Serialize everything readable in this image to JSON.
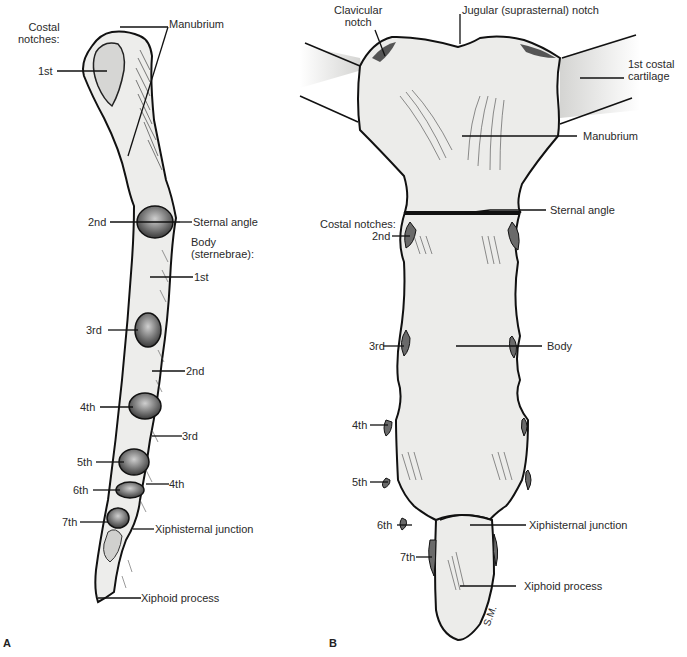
{
  "figure": {
    "panels": [
      {
        "id": "A",
        "view": "lateral",
        "panel_label": "A",
        "labels": {
          "manubrium": "Manubrium",
          "costal_notches_heading_1": "Costal",
          "costal_notches_heading_2": "notches:",
          "notch_1st": "1st",
          "notch_2nd": "2nd",
          "notch_3rd": "3rd",
          "notch_4th": "4th",
          "notch_5th": "5th",
          "notch_6th": "6th",
          "notch_7th": "7th",
          "sternal_angle": "Sternal angle",
          "body_heading_1": "Body",
          "body_heading_2": "(sternebrae):",
          "sternebra_1st": "1st",
          "sternebra_2nd": "2nd",
          "sternebra_3rd": "3rd",
          "sternebra_4th": "4th",
          "xiphisternal_junction": "Xiphisternal junction",
          "xiphoid_process": "Xiphoid process"
        }
      },
      {
        "id": "B",
        "view": "anterior",
        "panel_label": "B",
        "labels": {
          "clavicular_notch_1": "Clavicular",
          "clavicular_notch_2": "notch",
          "jugular_notch": "Jugular (suprasternal) notch",
          "costal_cartilage_1": "1st costal",
          "costal_cartilage_2": "cartilage",
          "manubrium": "Manubrium",
          "sternal_angle": "Sternal angle",
          "costal_notches_heading": "Costal notches:",
          "notch_2nd": "2nd",
          "notch_3rd": "3rd",
          "notch_4th": "4th",
          "notch_5th": "5th",
          "notch_6th": "6th",
          "notch_7th": "7th",
          "body": "Body",
          "xiphisternal_junction": "Xiphisternal junction",
          "xiphoid_process": "Xiphoid process",
          "signature": "S.M."
        }
      }
    ],
    "colors": {
      "bone_fill": "#ececea",
      "outline": "#111111",
      "notch_shade": "#777777",
      "cartilage_fill": "#e2e2e0",
      "label_text": "#2a2a2a"
    }
  }
}
